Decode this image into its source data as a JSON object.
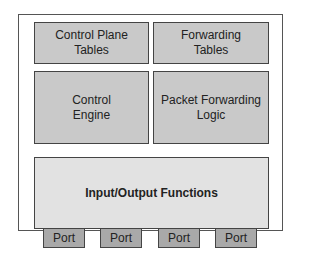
{
  "diagram": {
    "blocks": [
      {
        "id": "control-plane-tables",
        "label_line1": "Control Plane",
        "label_line2": "Tables"
      },
      {
        "id": "forwarding-tables",
        "label_line1": "Forwarding",
        "label_line2": "Tables"
      },
      {
        "id": "control-engine",
        "label_line1": "Control",
        "label_line2": "Engine"
      },
      {
        "id": "packet-forwarding-logic",
        "label_line1": "Packet Forwarding",
        "label_line2": "Logic"
      },
      {
        "id": "io-functions",
        "label": "Input/Output Functions"
      }
    ],
    "ports": [
      "Port",
      "Port",
      "Port",
      "Port"
    ],
    "colors": {
      "block": "#c9c9c9",
      "io": "#e2e2e2",
      "port": "#a9a9a9",
      "border": "#444444"
    }
  }
}
